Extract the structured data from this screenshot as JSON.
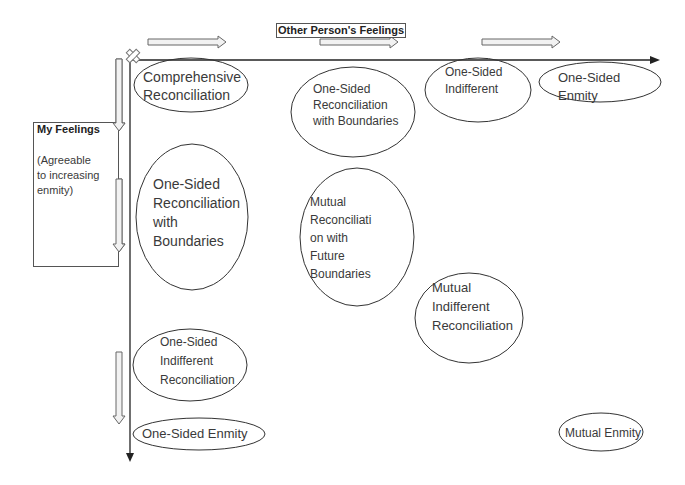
{
  "diagram": {
    "x_axis": {
      "title": "Other Person's Feelings"
    },
    "y_axis": {
      "title": "My Feelings",
      "subtitle_lines": [
        "(Agreeable",
        "to increasing",
        "enmity)"
      ]
    },
    "nodes": [
      {
        "id": "comprehensive",
        "lines": [
          "Comprehensive",
          "Reconciliation"
        ]
      },
      {
        "id": "one-sided-recon-boundaries-top",
        "lines": [
          "One-Sided",
          "Reconciliation",
          "with Boundaries"
        ]
      },
      {
        "id": "one-sided-indifferent-top",
        "lines": [
          "One-Sided",
          "Indifferent"
        ]
      },
      {
        "id": "one-sided-enmity-top",
        "lines": [
          "One-Sided",
          "Enmity"
        ]
      },
      {
        "id": "one-sided-recon-boundaries-left",
        "lines": [
          "One-Sided",
          "Reconciliation",
          "with",
          "Boundaries"
        ]
      },
      {
        "id": "mutual-recon-future",
        "lines": [
          "Mutual",
          "Reconciliati",
          "on with",
          "Future",
          "Boundaries"
        ]
      },
      {
        "id": "mutual-indifferent",
        "lines": [
          "Mutual",
          "Indifferent",
          "Reconciliation"
        ]
      },
      {
        "id": "one-sided-indifferent-recon",
        "lines": [
          "One-Sided",
          "Indifferent",
          "Reconciliation"
        ]
      },
      {
        "id": "one-sided-enmity-bottom",
        "lines": [
          "One-Sided Enmity"
        ]
      },
      {
        "id": "mutual-enmity",
        "lines": [
          "Mutual Enmity"
        ]
      }
    ]
  }
}
